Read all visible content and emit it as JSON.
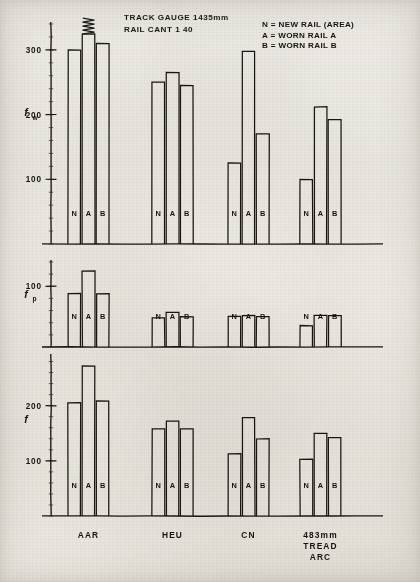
{
  "figure": {
    "header_lines": [
      "TRACK GAUGE 1435mm",
      "RAIL CANT 1 40"
    ],
    "legend": [
      "N = NEW RAIL  (AREA)",
      "A = WORN RAIL  A",
      "B = WORN RAIL  B"
    ],
    "series_keys": [
      "N",
      "A",
      "B"
    ],
    "break_note": "zigzag-break"
  },
  "chart_data": [
    {
      "type": "bar",
      "panel_id": "fw",
      "ylabel": "f",
      "ylabel_sub": "w",
      "categories": [
        "AAR",
        "HEU",
        "CN",
        "483mm TREAD ARC"
      ],
      "yticks": [
        100,
        200,
        300
      ],
      "ytick_labels": [
        "100",
        "200",
        "300"
      ],
      "ylim": [
        0,
        340
      ],
      "grid": false,
      "series": [
        {
          "name": "N",
          "values": [
            300,
            250,
            125,
            100
          ]
        },
        {
          "name": "A",
          "values": [
            345,
            265,
            298,
            212
          ],
          "broken": [
            true,
            false,
            false,
            false
          ]
        },
        {
          "name": "B",
          "values": [
            310,
            245,
            170,
            192
          ]
        }
      ]
    },
    {
      "type": "bar",
      "panel_id": "fp",
      "ylabel": "f",
      "ylabel_sub": "p",
      "categories": [
        "AAR",
        "HEU",
        "CN",
        "483mm TREAD ARC"
      ],
      "yticks": [
        100
      ],
      "ytick_labels": [
        "100"
      ],
      "ylim": [
        0,
        140
      ],
      "grid": false,
      "series": [
        {
          "name": "N",
          "values": [
            88,
            48,
            50,
            35
          ]
        },
        {
          "name": "A",
          "values": [
            125,
            57,
            52,
            52
          ]
        },
        {
          "name": "B",
          "values": [
            88,
            50,
            50,
            52
          ]
        }
      ]
    },
    {
      "type": "bar",
      "panel_id": "f",
      "ylabel": "f",
      "ylabel_sub": "",
      "categories": [
        "AAR",
        "HEU",
        "CN",
        "483mm TREAD ARC"
      ],
      "yticks": [
        100,
        200
      ],
      "ytick_labels": [
        "100",
        "200"
      ],
      "ylim": [
        0,
        290
      ],
      "grid": false,
      "series": [
        {
          "name": "N",
          "values": [
            205,
            158,
            113,
            103
          ]
        },
        {
          "name": "A",
          "values": [
            272,
            172,
            178,
            150
          ]
        },
        {
          "name": "B",
          "values": [
            208,
            158,
            140,
            142
          ]
        }
      ]
    }
  ],
  "xaxis": {
    "labels": [
      {
        "lines": [
          "AAR"
        ]
      },
      {
        "lines": [
          "HEU"
        ]
      },
      {
        "lines": [
          "CN"
        ]
      },
      {
        "lines": [
          "483mm",
          "TREAD",
          "ARC"
        ]
      }
    ]
  }
}
